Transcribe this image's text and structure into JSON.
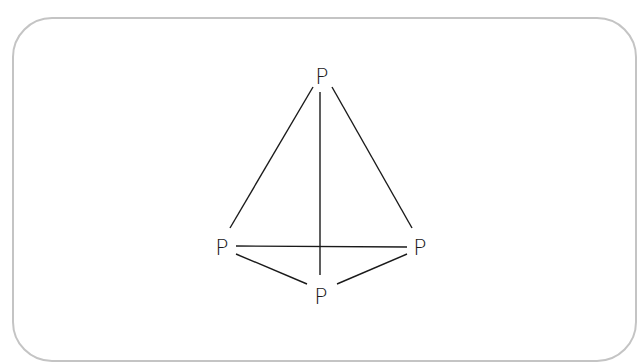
{
  "diagram": {
    "title": "",
    "frame": {
      "border_color": "#c4c4c4",
      "background": "#ffffff"
    },
    "nodes": [
      {
        "id": "top",
        "label": "P",
        "x": 322,
        "y": 83
      },
      {
        "id": "left",
        "label": "P",
        "x": 222,
        "y": 255
      },
      {
        "id": "right",
        "label": "P",
        "x": 420,
        "y": 255
      },
      {
        "id": "bottom",
        "label": "P",
        "x": 321,
        "y": 303
      }
    ],
    "edges": [
      {
        "from": "top",
        "to": "left"
      },
      {
        "from": "top",
        "to": "right"
      },
      {
        "from": "top",
        "to": "bottom"
      },
      {
        "from": "left",
        "to": "right"
      },
      {
        "from": "left",
        "to": "bottom"
      },
      {
        "from": "right",
        "to": "bottom"
      }
    ],
    "line_color": "#1a1a1a"
  }
}
